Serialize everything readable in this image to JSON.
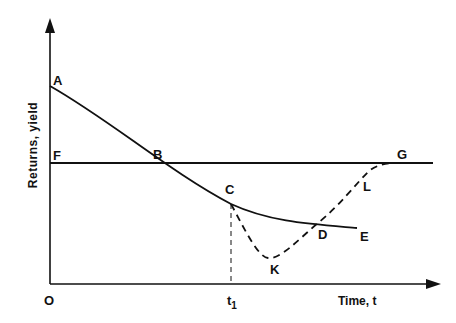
{
  "diagram": {
    "y_axis_label": "Returns, yield",
    "x_axis_label": "Time, t",
    "origin_label": "O",
    "t1_label": "t",
    "t1_subscript": "1",
    "points": {
      "A": "A",
      "B": "B",
      "C": "C",
      "D": "D",
      "E": "E",
      "F": "F",
      "G": "G",
      "K": "K",
      "L": "L"
    },
    "curves": [
      {
        "name": "declining-returns-ABCDE",
        "style": "solid",
        "points": [
          "A",
          "B",
          "C",
          "D",
          "E"
        ]
      },
      {
        "name": "constant-yield-FG",
        "style": "solid",
        "points": [
          "F",
          "B",
          "G"
        ]
      },
      {
        "name": "recovery-CKDLG",
        "style": "dashed",
        "points": [
          "C",
          "K",
          "D",
          "L",
          "G"
        ]
      },
      {
        "name": "t1-marker",
        "style": "dashed",
        "points": [
          "t1",
          "C"
        ]
      }
    ]
  }
}
